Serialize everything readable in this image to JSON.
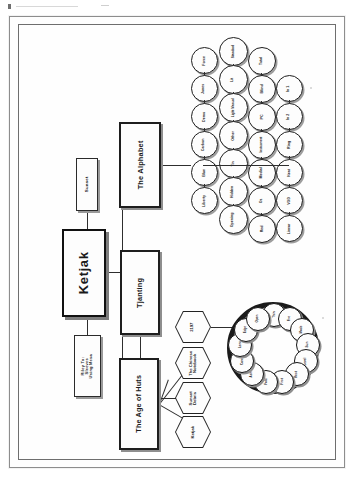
{
  "document": {
    "kind": "scanned-page",
    "orientation": "rotated-90",
    "page_background": "#fefefe",
    "ink_color": "#1f1f1f"
  },
  "diagram": {
    "title": "Ketjak",
    "root": {
      "label": "Ketjak"
    },
    "top_branches": [
      {
        "label": "Sunset"
      },
      {
        "label": "Riley To: Sleeves Using Mesa"
      }
    ],
    "main_branches": [
      {
        "label": "The Alphabet"
      },
      {
        "label": "Tjanting"
      },
      {
        "label": "The Age of Huts"
      }
    ],
    "hexagons": [
      {
        "label": "2197"
      },
      {
        "label": "The Chinese Notebook"
      },
      {
        "label": "Sunset Debris"
      },
      {
        "label": "Ketjak"
      }
    ],
    "alphabet_grid": {
      "row1": [
        "Force",
        "Jones",
        "Demo",
        "Carbon",
        "Blue",
        "Liberty"
      ],
      "row2": [
        "Standard",
        "Lit",
        "Light Manual",
        "Other",
        "Tin",
        "Hidden",
        "Opening"
      ],
      "row3": [
        "Total",
        "Blind",
        "PC",
        "Instrument",
        "Medial",
        "Oz",
        "Red"
      ],
      "row4": [
        "In 1",
        "In 2",
        "Ring",
        "Neat",
        "VOD",
        "Linear"
      ]
    },
    "ring_cluster": {
      "nodes": [
        "Thin",
        "Fire",
        "Mode",
        "Sun",
        "Level",
        "Rest",
        "First",
        "Fold",
        "Ash",
        "Core",
        "Lens",
        "Edge",
        "Open"
      ]
    }
  }
}
